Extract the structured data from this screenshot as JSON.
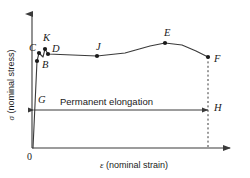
{
  "figure": {
    "background_color": "#ffffff",
    "line_color": "#3a3a3a",
    "width": 250,
    "height": 178
  },
  "axes": {
    "x_title_symbol": "ε",
    "x_title_text": " (nominal strain)",
    "y_title_symbol": "σ",
    "y_title_text": " (nominal stress)",
    "origin_label": "0",
    "x_axis_y": 148,
    "y_axis_x": 32,
    "x_axis_start": 32,
    "x_axis_end": 232,
    "y_axis_top": 12,
    "grid": false
  },
  "annotation": {
    "elongation_label": "Permanent elongation",
    "arrow_y": 110,
    "arrow_left_x": 34,
    "arrow_right_x": 208
  },
  "chart_data": {
    "type": "line",
    "title": "",
    "xlabel": "ε (nominal strain)",
    "ylabel": "σ (nominal stress)",
    "points": [
      {
        "label": "B",
        "x": 37,
        "y": 61,
        "label_dx": 5,
        "label_dy": -1
      },
      {
        "label": "C",
        "x": 39,
        "y": 53,
        "label_dx": -10,
        "label_dy": -10
      },
      {
        "label": "K",
        "x": 45,
        "y": 49,
        "label_dx": -2,
        "label_dy": -16
      },
      {
        "label": "D",
        "x": 48,
        "y": 54,
        "label_dx": 4,
        "label_dy": -10
      },
      {
        "label": "J",
        "x": 97,
        "y": 56,
        "label_dx": -1,
        "label_dy": -14
      },
      {
        "label": "E",
        "x": 165,
        "y": 43,
        "label_dx": -1,
        "label_dy": -15
      },
      {
        "label": "F",
        "x": 208,
        "y": 57,
        "label_dx": 6,
        "label_dy": -3
      },
      {
        "label": "G",
        "x": 34,
        "y": 110,
        "label_dx": 4,
        "label_dy": -15
      },
      {
        "label": "H",
        "x": 208,
        "y": 110,
        "label_dx": 6,
        "label_dy": -7
      }
    ],
    "curve_path": "M 33 148 L 37 61 L 39 53 L 43 57 L 45 49 L 48 54 L 97 56 L 125 53 L 150 46 L 165 43 L 182 45 L 196 51 L 208 57",
    "dashed_drop_line": {
      "x": 208,
      "y_top": 57,
      "y_bottom": 148
    }
  }
}
